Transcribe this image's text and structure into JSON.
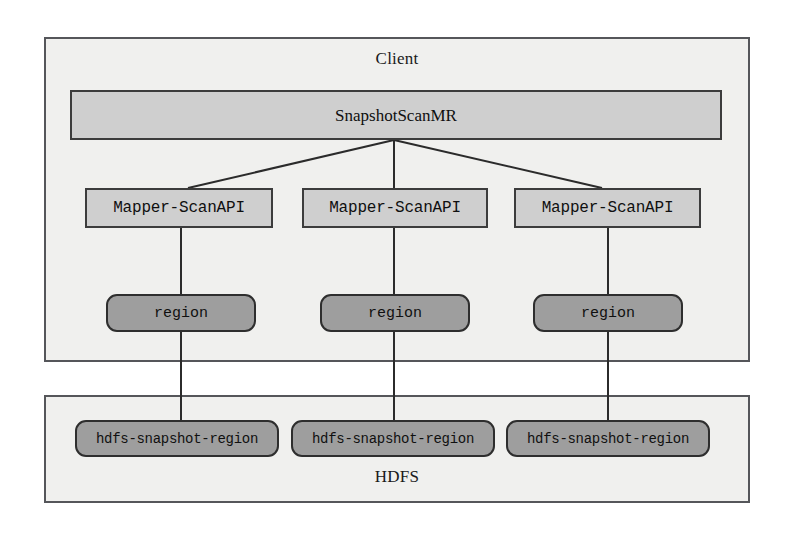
{
  "diagram": {
    "colors": {
      "container_fill": "#f0f0ee",
      "container_border": "#55565a",
      "master_fill": "#cfcfcf",
      "mapper_fill": "#cfcfcf",
      "region_fill": "#9e9e9e",
      "node_border": "#3c3c3c",
      "connector": "#2b2b2b",
      "text": "#101010",
      "page_background": "#ffffff"
    },
    "containers": [
      {
        "id": "client",
        "label": "Client"
      },
      {
        "id": "hdfs",
        "label": "HDFS"
      }
    ],
    "master": {
      "label": "SnapshotScanMR"
    },
    "mappers": [
      {
        "label": "Mapper-ScanAPI"
      },
      {
        "label": "Mapper-ScanAPI"
      },
      {
        "label": "Mapper-ScanAPI"
      }
    ],
    "regions": [
      {
        "label": "region"
      },
      {
        "label": "region"
      },
      {
        "label": "region"
      }
    ],
    "hdfs_regions": [
      {
        "label": "hdfs-snapshot-region"
      },
      {
        "label": "hdfs-snapshot-region"
      },
      {
        "label": "hdfs-snapshot-region"
      }
    ],
    "edges": [
      {
        "from": "SnapshotScanMR",
        "to": "Mapper-ScanAPI 1",
        "style": "diagonal"
      },
      {
        "from": "SnapshotScanMR",
        "to": "Mapper-ScanAPI 2",
        "style": "vertical"
      },
      {
        "from": "SnapshotScanMR",
        "to": "Mapper-ScanAPI 3",
        "style": "diagonal"
      },
      {
        "from": "Mapper-ScanAPI 1",
        "to": "region 1",
        "style": "vertical"
      },
      {
        "from": "Mapper-ScanAPI 2",
        "to": "region 2",
        "style": "vertical"
      },
      {
        "from": "Mapper-ScanAPI 3",
        "to": "region 3",
        "style": "vertical"
      },
      {
        "from": "region 1",
        "to": "hdfs-snapshot-region 1",
        "style": "vertical"
      },
      {
        "from": "region 2",
        "to": "hdfs-snapshot-region 2",
        "style": "vertical"
      },
      {
        "from": "region 3",
        "to": "hdfs-snapshot-region 3",
        "style": "vertical"
      }
    ]
  }
}
